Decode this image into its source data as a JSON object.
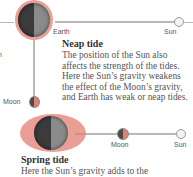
{
  "diagram": {
    "neap": {
      "earth_label": "Earth",
      "sun_label": "Sun",
      "moon_label": "Moon",
      "title": "Neap tide",
      "description": "The position of the Sun also affects the strength of the tides. Here the Sun’s gravity weakens the effect of the Moon’s gravity, and Earth has weak or neap tides."
    },
    "spring": {
      "moon_label": "Moon",
      "sun_label": "Sun",
      "title": "Spring tide",
      "description": "Here the Sun’s gravity adds to the"
    },
    "left_fragment": "n",
    "colors": {
      "tidal_bulge": "#e27f72",
      "earth_dark": "#3b3b3b",
      "earth_light": "#8b8b8b",
      "line": "#b9b9b9",
      "sun": "#f2f2f2"
    }
  }
}
